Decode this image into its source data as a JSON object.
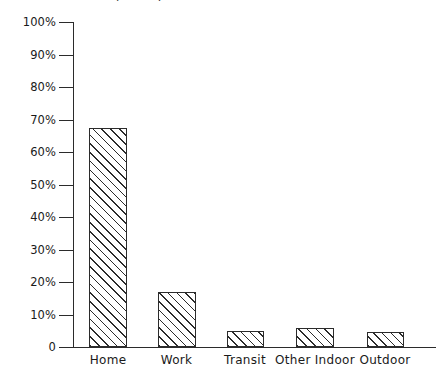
{
  "chart_data": {
    "type": "bar",
    "title": "Share of time spent by location",
    "xlabel": "",
    "ylabel": "",
    "categories": [
      "Home",
      "Work",
      "Transit",
      "Other Indoor",
      "Outdoor"
    ],
    "values": [
      67.5,
      17,
      5,
      6,
      4.5
    ],
    "value_labels": [
      "67.5%",
      "17%",
      "5%",
      "6%",
      "4.5%"
    ],
    "ylim": [
      0,
      100
    ],
    "ytick_labels": [
      "100%",
      "90%",
      "80%",
      "70%",
      "60%",
      "50%",
      "40%",
      "30%",
      "20%",
      "10%",
      "0"
    ],
    "ytick_values": [
      100,
      90,
      80,
      70,
      60,
      50,
      40,
      30,
      20,
      10,
      0
    ],
    "grid": false,
    "legend": false,
    "legend_position": "none",
    "bar_fill": "hatched-diagonal",
    "bar_edge_color": "#2b2b2b",
    "axis_color": "#2b2b2b",
    "background_color": "#ffffff"
  },
  "axes": {
    "y_ticks": [
      {
        "label": "100%",
        "value": 100
      },
      {
        "label": "90%",
        "value": 90
      },
      {
        "label": "80%",
        "value": 80
      },
      {
        "label": "70%",
        "value": 70
      },
      {
        "label": "60%",
        "value": 60
      },
      {
        "label": "50%",
        "value": 50
      },
      {
        "label": "40%",
        "value": 40
      },
      {
        "label": "30%",
        "value": 30
      },
      {
        "label": "20%",
        "value": 20
      },
      {
        "label": "10%",
        "value": 10
      },
      {
        "label": "0",
        "value": 0
      }
    ],
    "x_labels": [
      "Home",
      "Work",
      "Transit",
      "Other Indoor",
      "Outdoor"
    ]
  }
}
